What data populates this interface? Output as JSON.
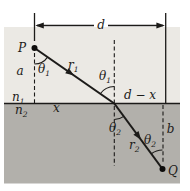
{
  "colors": {
    "background": "#ffffff",
    "medium1": "#ebe9e4",
    "medium2": "#b2b0ab",
    "line": "#1c1b19"
  },
  "labels": {
    "d": "d",
    "P": "P",
    "Q": "Q",
    "a": "a",
    "b": "b",
    "x": "x",
    "d_minus_x": "d − x",
    "n1": {
      "base": "n",
      "sub": "1"
    },
    "n2": {
      "base": "n",
      "sub": "2"
    },
    "r1": {
      "base": "r",
      "sub": "1"
    },
    "r2": {
      "base": "r",
      "sub": "2"
    },
    "theta1_at_P": {
      "base": "θ",
      "sub": "1"
    },
    "theta1_at_interface": {
      "base": "θ",
      "sub": "1"
    },
    "theta2_at_interface": {
      "base": "θ",
      "sub": "2"
    },
    "theta2_at_Q": {
      "base": "θ",
      "sub": "2"
    }
  }
}
